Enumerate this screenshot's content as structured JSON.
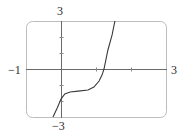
{
  "chart_data": {
    "type": "line",
    "title": "",
    "xlabel": "",
    "ylabel": "",
    "xlim": [
      -1,
      3
    ],
    "ylim": [
      -3,
      3
    ],
    "grid": false,
    "x_tick_labels": {
      "min": "−1",
      "max": "3"
    },
    "y_tick_labels": {
      "max": "3",
      "min": "−3"
    },
    "x_ticks": [
      1,
      2
    ],
    "y_ticks": [
      -2,
      -1,
      1,
      2
    ],
    "series": [
      {
        "name": "f(x)",
        "x": [
          -0.23,
          -0.11,
          0.0,
          0.11,
          0.26,
          0.49,
          0.77,
          0.94,
          1.09,
          1.17,
          1.23,
          1.34,
          1.46,
          1.54
        ],
        "y": [
          -3.0,
          -2.44,
          -1.88,
          -1.56,
          -1.44,
          -1.38,
          -1.31,
          -1.13,
          -0.75,
          -0.38,
          0.0,
          1.19,
          2.13,
          3.0
        ]
      }
    ],
    "colors": {
      "axis": "#6a6a6a",
      "curve": "#3a3a3a",
      "frame": "#bdbdbd"
    }
  }
}
